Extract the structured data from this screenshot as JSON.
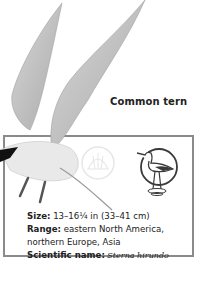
{
  "title": "Common tern",
  "fields": [
    {
      "label": "Size:",
      "value": " 13–16¼ in (33–41 cm)"
    },
    {
      "label": "Range:",
      "value": " eastern North America, northern Europe, Asia"
    },
    {
      "label": "Scientific name:",
      "value": " Sterna hirundo"
    }
  ],
  "icons": [
    "shell-icon",
    "wading-bird-icon"
  ],
  "colors": {
    "border": "#8a8a8a",
    "text": "#222222",
    "shell": "#e6e6e6",
    "wader": "#3a3a3a"
  }
}
